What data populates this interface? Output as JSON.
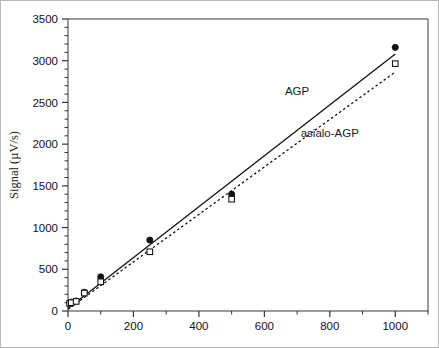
{
  "chart_data": {
    "type": "scatter",
    "title": "",
    "xlabel": "",
    "ylabel": "Signal (µV/s)",
    "xlim": [
      0,
      1100
    ],
    "ylim": [
      0,
      3500
    ],
    "x_ticks": [
      0,
      200,
      400,
      600,
      800,
      1000
    ],
    "y_ticks": [
      0,
      500,
      1000,
      1500,
      2000,
      2500,
      3000,
      3500
    ],
    "x_minor_step": 100,
    "y_minor_step": 100,
    "grid": false,
    "legend_position": "inline-annotation",
    "series": [
      {
        "name": "AGP",
        "marker": "filled-circle",
        "line_style": "solid",
        "color": "#111111",
        "x": [
          5,
          10,
          25,
          50,
          100,
          250,
          500,
          1000
        ],
        "y": [
          95,
          105,
          120,
          225,
          410,
          850,
          1400,
          3160
        ],
        "fit_line": {
          "x0": 0,
          "y0": 30,
          "x1": 1000,
          "y1": 3080
        }
      },
      {
        "name": "asialo-AGP",
        "marker": "open-square",
        "line_style": "dashed",
        "color": "#111111",
        "x": [
          5,
          10,
          25,
          50,
          100,
          250,
          500,
          1000
        ],
        "y": [
          90,
          100,
          115,
          215,
          350,
          710,
          1340,
          2965
        ],
        "fit_line": {
          "x0": 0,
          "y0": 20,
          "x1": 1000,
          "y1": 2865
        }
      }
    ],
    "annotations": [
      {
        "text": "AGP",
        "x": 700,
        "y": 2590
      },
      {
        "text": "asialo-AGP",
        "x": 800,
        "y": 2090
      }
    ]
  },
  "axes": {
    "y_title": "Signal (µV/s)",
    "y_tick_labels": [
      "3500",
      "3000",
      "2500",
      "2000",
      "1500",
      "1000",
      "500",
      "0"
    ],
    "x_tick_labels": [
      "0",
      "200",
      "400",
      "600",
      "800",
      "1000"
    ]
  },
  "labels": {
    "agp": "AGP",
    "asialo_agp": "asialo-AGP"
  }
}
